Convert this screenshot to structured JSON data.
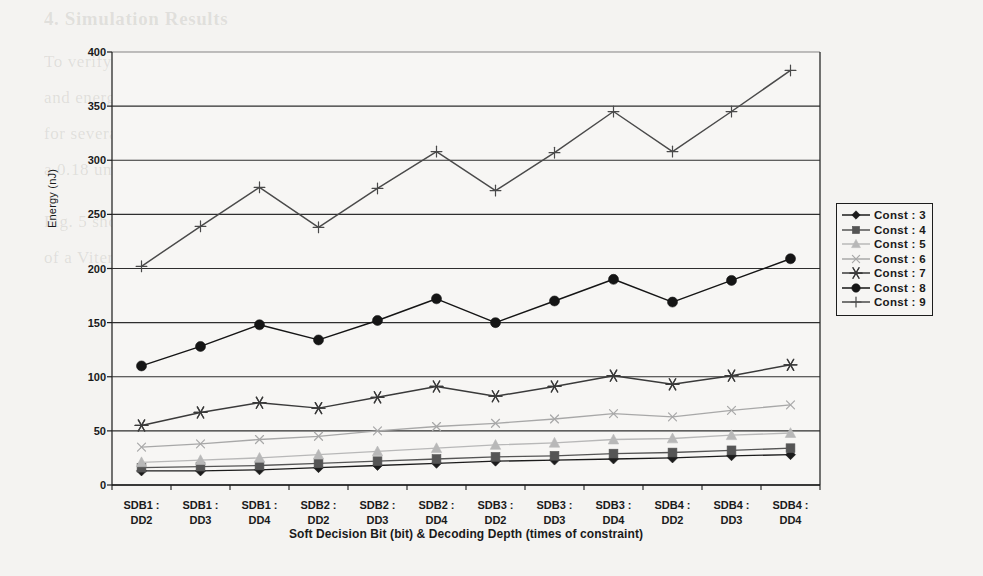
{
  "chart_data": {
    "type": "line",
    "title": "",
    "xlabel": "Soft Decision Bit (bit) & Decoding Depth (times of constraint)",
    "ylabel": "Energy (nJ)",
    "ylim": [
      0,
      400
    ],
    "ytick_step": 50,
    "yticks": [
      "400",
      "350",
      "300",
      "250",
      "200",
      "150",
      "100",
      "50",
      "0"
    ],
    "grid": "horizontal",
    "legend_position": "right",
    "categories": [
      "SDB1 :\nDD2",
      "SDB1 :\nDD3",
      "SDB1 :\nDD4",
      "SDB2 :\nDD2",
      "SDB2 :\nDD3",
      "SDB2 :\nDD4",
      "SDB3 :\nDD2",
      "SDB3 :\nDD3",
      "SDB3 :\nDD4",
      "SDB4 :\nDD2",
      "SDB4 :\nDD3",
      "SDB4 :\nDD4"
    ],
    "category_lines": [
      [
        "SDB1 :",
        "DD2"
      ],
      [
        "SDB1 :",
        "DD3"
      ],
      [
        "SDB1 :",
        "DD4"
      ],
      [
        "SDB2 :",
        "DD2"
      ],
      [
        "SDB2 :",
        "DD3"
      ],
      [
        "SDB2 :",
        "DD4"
      ],
      [
        "SDB3 :",
        "DD2"
      ],
      [
        "SDB3 :",
        "DD3"
      ],
      [
        "SDB3 :",
        "DD4"
      ],
      [
        "SDB4 :",
        "DD2"
      ],
      [
        "SDB4 :",
        "DD3"
      ],
      [
        "SDB4 :",
        "DD4"
      ]
    ],
    "series": [
      {
        "name": "Const : 3",
        "marker": "diamond",
        "color": "#1c1c1c",
        "values": [
          13,
          13,
          14,
          16,
          18,
          20,
          22,
          23,
          24,
          25,
          27,
          28
        ]
      },
      {
        "name": "Const : 4",
        "marker": "square",
        "color": "#555555",
        "values": [
          16,
          17,
          18,
          20,
          22,
          24,
          26,
          27,
          29,
          30,
          32,
          34
        ]
      },
      {
        "name": "Const : 5",
        "marker": "triangle",
        "color": "#b8b8b8",
        "values": [
          21,
          23,
          25,
          28,
          31,
          34,
          37,
          39,
          42,
          43,
          46,
          48
        ]
      },
      {
        "name": "Const : 6",
        "marker": "x",
        "color": "#a8a8a8",
        "values": [
          35,
          38,
          42,
          45,
          50,
          54,
          57,
          61,
          66,
          63,
          69,
          74
        ]
      },
      {
        "name": "Const : 7",
        "marker": "asterisk",
        "color": "#3a3a3a",
        "values": [
          55,
          67,
          76,
          71,
          81,
          91,
          82,
          91,
          101,
          93,
          101,
          111
        ]
      },
      {
        "name": "Const : 8",
        "marker": "circle",
        "color": "#151515",
        "values": [
          110,
          128,
          148,
          134,
          152,
          172,
          150,
          170,
          190,
          169,
          189,
          209
        ]
      },
      {
        "name": "Const : 9",
        "marker": "plus",
        "color": "#4a4a4a",
        "values": [
          202,
          239,
          275,
          238,
          274,
          308,
          272,
          307,
          345,
          308,
          345,
          383
        ]
      }
    ]
  },
  "legend": {
    "items": [
      {
        "label": "Const : 3"
      },
      {
        "label": "Const : 4"
      },
      {
        "label": "Const : 5"
      },
      {
        "label": "Const : 6"
      },
      {
        "label": "Const : 7"
      },
      {
        "label": "Const : 8"
      },
      {
        "label": "Const : 9"
      }
    ]
  },
  "background_text": [
    {
      "text": "4. Simulation Results",
      "x": 44,
      "y": 8,
      "size": 19,
      "weight": "bold"
    },
    {
      "text": "To verify the effectiveness of the proposed architecture, the power consumption",
      "x": 44,
      "y": 52,
      "size": 17
    },
    {
      "text": "and energy dissipation per decoded bit of the Viterbi decoder were estimated",
      "x": 44,
      "y": 88,
      "size": 17
    },
    {
      "text": "for several constraint lengths, soft decision bits and decoding depths under",
      "x": 44,
      "y": 124,
      "size": 17
    },
    {
      "text": "a 0.18 um CMOS standard cell library.",
      "x": 44,
      "y": 160,
      "size": 17
    },
    {
      "text": "Fig. 5 shows the energy dissipation per decoded bit when the SDB and DD",
      "x": 44,
      "y": 212,
      "size": 17
    },
    {
      "text": "of a Viterbi decoder vary. The energy increases as the constraint length",
      "x": 44,
      "y": 248,
      "size": 17
    }
  ]
}
